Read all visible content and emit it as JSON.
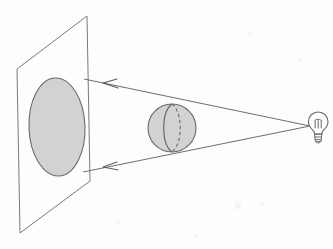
{
  "figure": {
    "caption": "",
    "background_color": "#fdfdfc",
    "line_color": "#6f6f72",
    "fill_color": "#d2d2d2",
    "width": 333,
    "height": 249
  },
  "elements": {
    "projection_plane": {
      "name": "projection-plane",
      "label": "",
      "shape": "parallelogram",
      "points": "17,69 87,16 90,181 20,233",
      "stroke": "#7a7a7d",
      "fill": "none"
    },
    "shadow_ellipse": {
      "name": "shadow-ellipse",
      "label": "",
      "shape": "ellipse",
      "cx": 57,
      "cy": 127,
      "rx": 28,
      "ry": 49,
      "rotation": -2,
      "fill": "#d2d2d2",
      "stroke": "#6a6a6d"
    },
    "sphere": {
      "name": "sphere",
      "label": "",
      "shape": "circle",
      "cx": 172,
      "cy": 128,
      "r": 24,
      "fill": "#d2d2d2",
      "stroke": "#6a6a6d",
      "meridian_front": "M 172,104 C 161,112 161,144 172,152",
      "meridian_back": "M 172,104 C 183,112 183,144 172,152"
    },
    "light_bulb": {
      "name": "light-bulb",
      "label": "",
      "glass_cx": 318,
      "glass_cy": 122,
      "glass_r": 9.5,
      "fill": "#fefefe",
      "stroke": "#69696d"
    },
    "ray_upper": {
      "name": "ray-upper",
      "label": "",
      "from": "310,126",
      "to": "84,79",
      "arrow_at": "112,84"
    },
    "ray_lower": {
      "name": "ray-lower",
      "label": "",
      "from": "310,126",
      "to": "83,172",
      "arrow_at": "112,166"
    }
  },
  "chart_data": {
    "type": "diagram",
    "objects": [
      {
        "id": "light-source",
        "kind": "point-light",
        "x": 310,
        "y": 126,
        "note": "light bulb filament acting as point source"
      },
      {
        "id": "sphere",
        "kind": "occluder",
        "x": 172,
        "y": 128,
        "radius": 24,
        "note": "opaque sphere with visible front meridian and hidden dashed back meridian"
      },
      {
        "id": "plane",
        "kind": "screen",
        "note": "flat parallelogram screen seen in perspective"
      },
      {
        "id": "shadow",
        "kind": "projection",
        "x": 57,
        "y": 127,
        "semi_major": 49,
        "semi_minor": 28,
        "note": "elliptical umbra cast on the screen"
      }
    ],
    "rays": [
      {
        "id": "ray-upper",
        "from": [
          310,
          126
        ],
        "to": [
          84,
          79
        ],
        "arrow_direction": "left",
        "tangent_to": "sphere-top"
      },
      {
        "id": "ray-lower",
        "from": [
          310,
          126
        ],
        "to": [
          83,
          172
        ],
        "arrow_direction": "left",
        "tangent_to": "sphere-bottom"
      }
    ],
    "annotations": [],
    "legend": [],
    "grid": false
  }
}
